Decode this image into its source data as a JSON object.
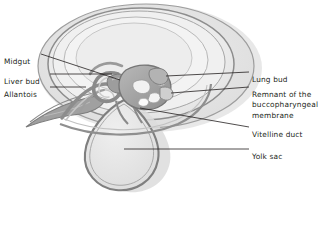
{
  "figure": {
    "type": "anatomical-diagram",
    "palette": {
      "background": "#ffffff",
      "text": "#231f20",
      "leader_line": "#231f20",
      "amnion_fill": "#ededed",
      "amnion_stroke": "#8d8d8d",
      "chorion_fill": "#e3e3e3",
      "chorion_stroke": "#9a9a9a",
      "cavity_fill": "#efefef",
      "yolk_sac_fill": "#e6e6e6",
      "yolk_sac_stroke": "#7f7f7f",
      "gut_dark": "#8a8a8a",
      "gut_mid": "#a8a8a8",
      "gut_light": "#d2d2d2",
      "allantois_fill": "#9d9d9d",
      "shadow": "#d8d8d8"
    }
  },
  "labels": {
    "left": [
      {
        "id": "midgut",
        "text": "Midgut",
        "x": 4,
        "y": 57
      },
      {
        "id": "liver-bud",
        "text": "Liver bud",
        "x": 4,
        "y": 77
      },
      {
        "id": "allantois",
        "text": "Allantois",
        "x": 4,
        "y": 90
      }
    ],
    "right": [
      {
        "id": "lung-bud",
        "text": "Lung bud",
        "x": 252,
        "y": 75
      },
      {
        "id": "remnant-line1",
        "text": "Remnant of the",
        "x": 252,
        "y": 90
      },
      {
        "id": "remnant-line2",
        "text": "buccopharyngeal",
        "x": 252,
        "y": 100
      },
      {
        "id": "remnant-line3",
        "text": "membrane",
        "x": 252,
        "y": 111
      },
      {
        "id": "vitelline-duct",
        "text": "Vitelline duct",
        "x": 252,
        "y": 130
      },
      {
        "id": "yolk-sac",
        "text": "Yolk sac",
        "x": 252,
        "y": 152
      }
    ]
  }
}
